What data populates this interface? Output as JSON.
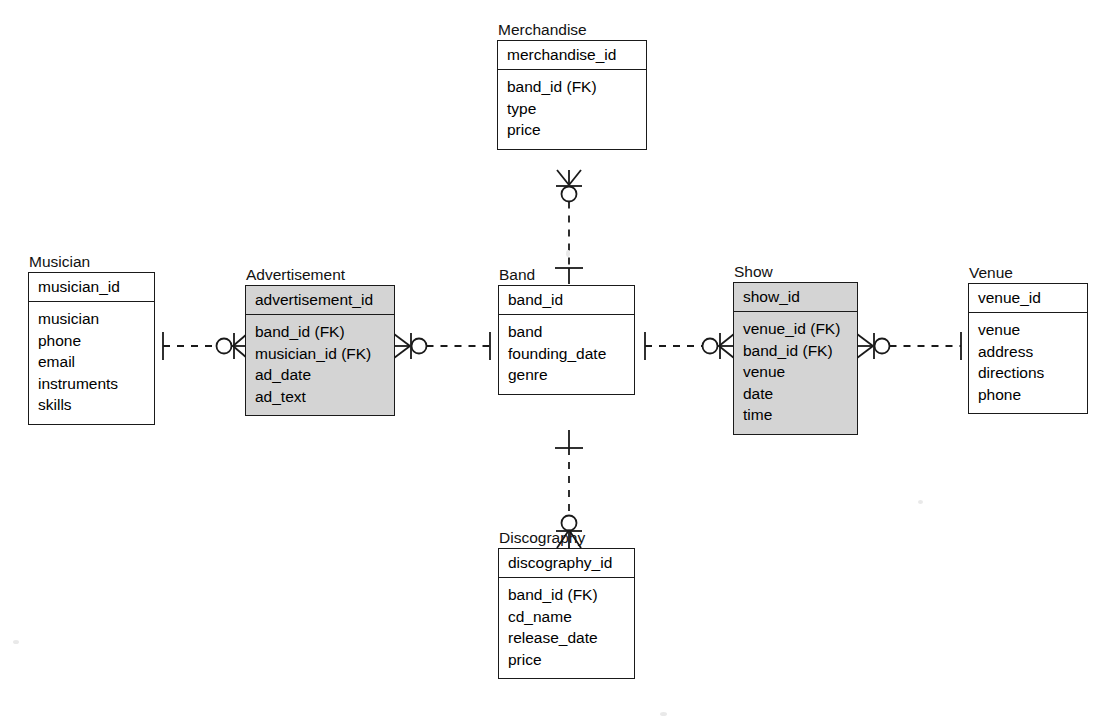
{
  "diagram": {
    "notation": "crow's foot",
    "colors": {
      "line": "#1a1a1a",
      "shaded_entity_fill": "#d4d4d4",
      "plain_entity_fill": "#ffffff",
      "background": "#ffffff"
    }
  },
  "entities": [
    {
      "id": "merchandise",
      "name": "Merchandise",
      "shaded": false,
      "primary_key": "merchandise_id",
      "attributes": [
        "band_id (FK)",
        "type",
        "price"
      ]
    },
    {
      "id": "musician",
      "name": "Musician",
      "shaded": false,
      "primary_key": "musician_id",
      "attributes": [
        "musician",
        "phone",
        "email",
        "instruments",
        "skills"
      ]
    },
    {
      "id": "advertisement",
      "name": "Advertisement",
      "shaded": true,
      "primary_key": "advertisement_id",
      "attributes": [
        "band_id (FK)",
        "musician_id (FK)",
        "ad_date",
        "ad_text"
      ]
    },
    {
      "id": "band",
      "name": "Band",
      "shaded": false,
      "primary_key": "band_id",
      "attributes": [
        "band",
        "founding_date",
        "genre"
      ]
    },
    {
      "id": "show",
      "name": "Show",
      "shaded": true,
      "primary_key": "show_id",
      "attributes": [
        "venue_id (FK)",
        "band_id (FK)",
        "venue",
        "date",
        "time"
      ]
    },
    {
      "id": "venue",
      "name": "Venue",
      "shaded": false,
      "primary_key": "venue_id",
      "attributes": [
        "venue",
        "address",
        "directions",
        "phone"
      ]
    },
    {
      "id": "discography",
      "name": "Discography",
      "shaded": false,
      "primary_key": "discography_id",
      "attributes": [
        "band_id (FK)",
        "cd_name",
        "release_date",
        "price"
      ]
    }
  ],
  "relationships": [
    {
      "id": "musician-advertisement",
      "from": "Musician",
      "to": "Advertisement",
      "from_cardinality": "one-and-only-one",
      "to_cardinality": "zero-or-many",
      "line_style": "dashed"
    },
    {
      "id": "advertisement-band",
      "from": "Advertisement",
      "to": "Band",
      "from_cardinality": "zero-or-many",
      "to_cardinality": "one-and-only-one",
      "line_style": "dashed"
    },
    {
      "id": "merchandise-band",
      "from": "Merchandise",
      "to": "Band",
      "from_cardinality": "zero-or-many",
      "to_cardinality": "one-and-only-one",
      "line_style": "dashed"
    },
    {
      "id": "band-discography",
      "from": "Band",
      "to": "Discography",
      "from_cardinality": "one-and-only-one",
      "to_cardinality": "zero-or-many",
      "line_style": "dashed"
    },
    {
      "id": "band-show",
      "from": "Band",
      "to": "Show",
      "from_cardinality": "one-and-only-one",
      "to_cardinality": "zero-or-many",
      "line_style": "dashed"
    },
    {
      "id": "show-venue",
      "from": "Show",
      "to": "Venue",
      "from_cardinality": "zero-or-many",
      "to_cardinality": "one-and-only-one",
      "line_style": "dashed"
    }
  ]
}
